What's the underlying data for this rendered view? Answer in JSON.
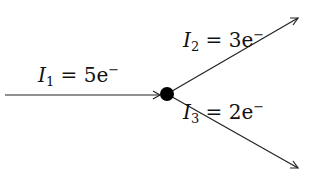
{
  "diagram": {
    "node": {
      "cx": 167,
      "cy": 94,
      "r": 7
    },
    "currents": [
      {
        "id": "I1",
        "symbol": "I",
        "sub": "1",
        "eq": " = ",
        "value": "5e",
        "sup": "−",
        "direction": "in"
      },
      {
        "id": "I2",
        "symbol": "I",
        "sub": "2",
        "eq": " = ",
        "value": "3e",
        "sup": "−",
        "direction": "out"
      },
      {
        "id": "I3",
        "symbol": "I",
        "sub": "3",
        "eq": " = ",
        "value": "2e",
        "sup": "−",
        "direction": "out"
      }
    ],
    "colors": {
      "stroke": "#222222",
      "node": "#000000",
      "text": "#111111"
    }
  }
}
